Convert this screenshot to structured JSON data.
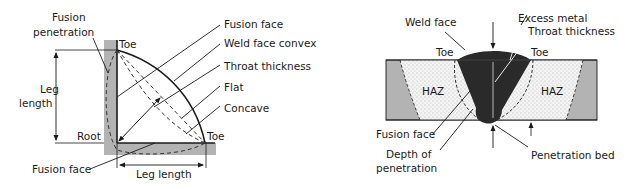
{
  "fillet_weld": {
    "labels": {
      "fusion_penetration_1": "Fusion",
      "fusion_penetration_2": "penetration",
      "toe_top": "Toe",
      "toe_right": "Toe",
      "root": "Root",
      "leg_length_vertical_1": "Leg",
      "leg_length_vertical_2": "length",
      "leg_length_horizontal": "Leg length",
      "fusion_face_bottom": "Fusion face",
      "fusion_face_right": "Fusion face",
      "weld_face_convex": "Weld face convex",
      "throat_thickness": "Throat thickness",
      "flat": "Flat",
      "concave": "Concave"
    }
  },
  "butt_weld": {
    "labels": {
      "weld_face": "Weld face",
      "excess_metal": "Excess metal",
      "throat_thickness": "Throat thickness",
      "toe_left": "Toe",
      "toe_right": "Toe",
      "haz_left": "HAZ",
      "haz_right": "HAZ",
      "fusion_face": "Fusion face",
      "depth_of_penetration_1": "Depth of",
      "depth_of_penetration_2": "penetration",
      "penetration_bed": "Penetration bed"
    }
  },
  "colors": {
    "plate_gray": "#b3b3b3",
    "weld_black": "#2a2a2a",
    "line": "#1a1a1a",
    "haz_fill": "#f2f2f2"
  }
}
